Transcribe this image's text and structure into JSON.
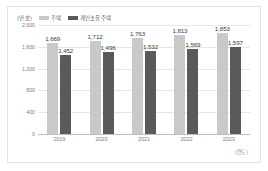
{
  "chart_data": {
    "type": "bar",
    "title": "",
    "xlabel": "(연도)",
    "ylabel": "(만 호)",
    "unit_label": "(만 호)",
    "categories": [
      "2019",
      "2020",
      "2021",
      "2022",
      "2023"
    ],
    "series": [
      {
        "name": "주택",
        "color": "#c9c9c9",
        "values": [
          1669,
          1712,
          1763,
          1813,
          1853
        ],
        "labels": [
          "1,669",
          "1,712",
          "1,763",
          "1,813",
          "1,853"
        ]
      },
      {
        "name": "개인소유 주택",
        "color": "#5a5a5a",
        "values": [
          1452,
          1496,
          1532,
          1569,
          1597
        ],
        "labels": [
          "1,452",
          "1,496",
          "1,532",
          "1,569",
          "1,597"
        ]
      }
    ],
    "ylim": [
      0,
      2000
    ],
    "yticks": [
      2000,
      1600,
      1200,
      800,
      400,
      0
    ],
    "ytick_labels": [
      "2,000",
      "1,600",
      "1,200",
      "800",
      "400",
      "0"
    ],
    "grid": true,
    "legend_position": "top-left"
  }
}
